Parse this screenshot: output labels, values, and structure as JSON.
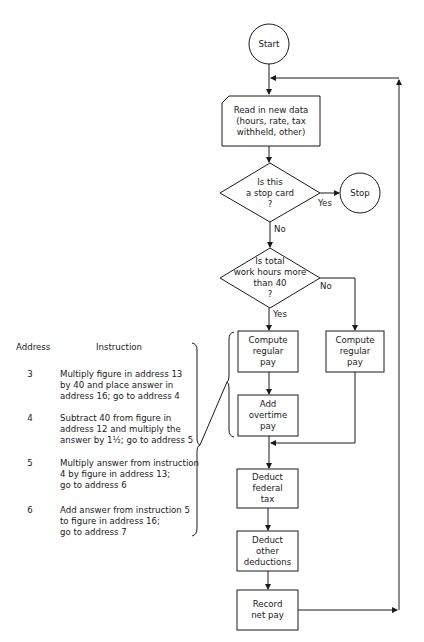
{
  "flowchart": {
    "start": "Start",
    "read_data": "Read in new data\n(hours, rate, tax\nwithheld, other)",
    "decision_stop": "Is this\na stop card\n?",
    "stop": "Stop",
    "decision_stop_yes": "Yes",
    "decision_stop_no": "No",
    "decision_hours": "Is total\nwork hours more\nthan 40\n?",
    "decision_hours_yes": "Yes",
    "decision_hours_no": "No",
    "compute_regular_pay_left": "Compute\nregular\npay",
    "add_overtime_pay": "Add\novertime\npay",
    "compute_regular_pay_right": "Compute\nregular\npay",
    "deduct_federal_tax": "Deduct\nfederal\ntax",
    "deduct_other": "Deduct\nother\ndeductions",
    "record_net_pay": "Record\nnet pay"
  },
  "instruction_table": {
    "header_address": "Address",
    "header_instruction": "Instruction",
    "rows": [
      {
        "address": "3",
        "instruction": "Multiply figure in address 13\nby 40 and place answer in\naddress 16; go to address 4"
      },
      {
        "address": "4",
        "instruction": "Subtract 40 from figure in\naddress 12 and multiply the\nanswer by 1½; go to address 5"
      },
      {
        "address": "5",
        "instruction": "Multiply answer from instruction\n4 by figure in address 13;\ngo to address 6"
      },
      {
        "address": "6",
        "instruction": "Add answer from instruction 5\nto figure in address 16;\ngo to address 7"
      }
    ]
  }
}
